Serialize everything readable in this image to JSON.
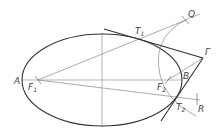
{
  "diagram": {
    "type": "geometric-construction",
    "colors": {
      "ellipse": "#333333",
      "tangent": "#333333",
      "construction": "#888888",
      "label": "#444444"
    },
    "labels": {
      "A": "A",
      "B": "B",
      "F1": "F",
      "F1_sub": "1",
      "F2": "F",
      "F2_sub": "2",
      "Q": "Q",
      "P": "Γ",
      "R": "R",
      "T1": "T",
      "T1_sub": "1",
      "T2": "T",
      "T2_sub": "2"
    }
  }
}
